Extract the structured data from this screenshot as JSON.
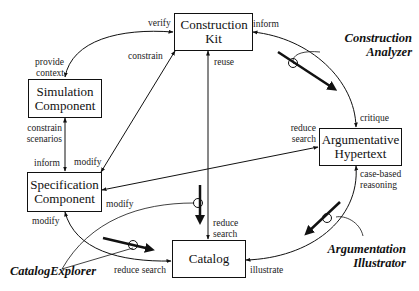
{
  "diagram": {
    "nodes": [
      {
        "id": "construction_kit",
        "label": "Construction Kit"
      },
      {
        "id": "simulation_component",
        "label": "Simulation Component"
      },
      {
        "id": "specification_component",
        "label": "Specification Component"
      },
      {
        "id": "argumentative_hypertext",
        "label": "Argumentative Hypertext"
      },
      {
        "id": "catalog",
        "label": "Catalog"
      }
    ],
    "edge_labels": {
      "verify": "verify",
      "provide_context": "provide context",
      "constrain": "constrain",
      "inform_top": "inform",
      "reuse": "reuse",
      "critique": "critique",
      "reduce_search_hyper": "reduce search",
      "case_based_reasoning": "case-based reasoning",
      "constrain_scenarios": "constrain scenarios",
      "inform_left": "inform",
      "modify_top": "modify",
      "modify_right": "modify",
      "modify_bottom": "modify",
      "reduce_search_catalog_top": "reduce search",
      "reduce_search_catalog_left": "reduce search",
      "illustrate": "illustrate"
    },
    "tools": {
      "construction_analyzer": "Construction Analyzer",
      "argumentation_illustrator": "Argumentation Illustrator",
      "catalog_explorer": "CatalogExplorer"
    },
    "colors": {
      "line": "#111111",
      "background": "#ffffff"
    }
  }
}
